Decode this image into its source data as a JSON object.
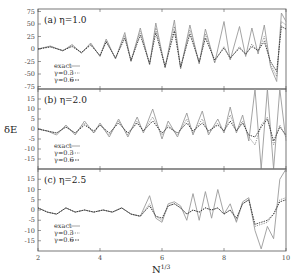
{
  "chart_data": {
    "type": "line",
    "xlabel": "N^{1/3}",
    "ylabel": "δE",
    "xlim": [
      2,
      10
    ],
    "x_ticks": [
      2,
      4,
      6,
      8,
      10
    ],
    "legend_position": "lower-left (inside each panel)",
    "grid": false,
    "series_styles": {
      "exact": {
        "color": "#9a9a9a",
        "dash": "",
        "width": 0.9
      },
      "γ=0.3": {
        "color": "#777777",
        "dash": "1.2,1.2",
        "width": 0.8
      },
      "γ=0.6": {
        "color": "#333333",
        "dash": "1.5,1",
        "width": 0.9
      }
    },
    "panels": [
      {
        "id": "a",
        "label": "(a) η=1.0",
        "ylim": [
          -80,
          80
        ],
        "y_ticks": [
          75,
          50,
          25,
          0,
          -25,
          -50,
          -75
        ],
        "legend": [
          "exact",
          "γ=0.3",
          "γ=0.6"
        ],
        "series": [
          {
            "name": "exact",
            "x": [
              2.0,
              2.4,
              2.8,
              3.1,
              3.4,
              3.7,
              4.0,
              4.2,
              4.5,
              4.8,
              5.0,
              5.3,
              5.6,
              5.8,
              6.1,
              6.4,
              6.6,
              6.9,
              7.2,
              7.4,
              7.7,
              8.0,
              8.2,
              8.5,
              8.7,
              8.9,
              9.1,
              9.3,
              9.5,
              9.7,
              9.85,
              10.0
            ],
            "y": [
              0,
              6,
              -4,
              9,
              -8,
              12,
              -15,
              20,
              -20,
              33,
              -25,
              42,
              -32,
              52,
              -38,
              58,
              -40,
              48,
              -30,
              40,
              -28,
              55,
              -22,
              45,
              -15,
              42,
              -10,
              48,
              -35,
              -65,
              72,
              55
            ]
          },
          {
            "name": "γ=0.3",
            "x": [
              2.0,
              2.4,
              2.8,
              3.1,
              3.4,
              3.7,
              4.0,
              4.2,
              4.5,
              4.8,
              5.0,
              5.3,
              5.6,
              5.8,
              6.1,
              6.4,
              6.6,
              6.9,
              7.2,
              7.4,
              7.7,
              8.0,
              8.2,
              8.5,
              8.7,
              8.9,
              9.1,
              9.3,
              9.5,
              9.7,
              9.85,
              10.0
            ],
            "y": [
              0,
              5,
              -3,
              7,
              -8,
              10,
              -14,
              17,
              -19,
              27,
              -24,
              35,
              -30,
              42,
              -36,
              45,
              -38,
              38,
              -28,
              30,
              -25,
              5,
              -20,
              5,
              -12,
              10,
              -5,
              25,
              -30,
              -55,
              55,
              48
            ]
          },
          {
            "name": "γ=0.6",
            "x": [
              2.0,
              2.4,
              2.8,
              3.1,
              3.4,
              3.7,
              4.0,
              4.2,
              4.5,
              4.8,
              5.0,
              5.3,
              5.6,
              5.8,
              6.1,
              6.4,
              6.6,
              6.9,
              7.2,
              7.4,
              7.7,
              8.0,
              8.2,
              8.5,
              8.7,
              8.9,
              9.1,
              9.3,
              9.5,
              9.7,
              9.85,
              10.0
            ],
            "y": [
              0,
              4,
              -3,
              5,
              -7,
              8,
              -13,
              14,
              -18,
              22,
              -23,
              28,
              -29,
              33,
              -35,
              36,
              -36,
              30,
              -26,
              22,
              -22,
              2,
              -18,
              2,
              -10,
              5,
              -3,
              15,
              -25,
              -45,
              45,
              40
            ]
          }
        ]
      },
      {
        "id": "b",
        "label": "(b) η=2.0",
        "ylim": [
          -20,
          20
        ],
        "y_ticks": [
          15,
          10,
          5,
          0,
          -5,
          -10,
          -15
        ],
        "legend": [
          "exact",
          "γ=0.3",
          "γ=0.6"
        ],
        "series": [
          {
            "name": "exact",
            "x": [
              2.0,
              2.3,
              2.6,
              2.9,
              3.2,
              3.5,
              3.8,
              4.0,
              4.3,
              4.6,
              4.9,
              5.2,
              5.4,
              5.7,
              6.0,
              6.2,
              6.5,
              6.8,
              7.0,
              7.3,
              7.5,
              7.8,
              8.0,
              8.2,
              8.4,
              8.6,
              8.8,
              9.0,
              9.2,
              9.4,
              9.6,
              9.8,
              10.0
            ],
            "y": [
              0,
              -1,
              -3,
              2,
              -3,
              4,
              -2,
              3,
              -4,
              5,
              -4,
              6,
              -2,
              10,
              -5,
              4,
              -4,
              8,
              -3,
              9,
              -3,
              5,
              -2,
              11,
              -2,
              7,
              -6,
              20,
              -20,
              20,
              -20,
              20,
              -6
            ]
          },
          {
            "name": "γ=0.3",
            "x": [
              2.0,
              2.3,
              2.6,
              2.9,
              3.2,
              3.5,
              3.8,
              4.0,
              4.3,
              4.6,
              4.9,
              5.2,
              5.4,
              5.7,
              6.0,
              6.2,
              6.5,
              6.8,
              7.0,
              7.3,
              7.5,
              7.8,
              8.0,
              8.2,
              8.4,
              8.6,
              8.8,
              9.0,
              9.2,
              9.4,
              9.6,
              9.8,
              10.0
            ],
            "y": [
              0,
              -1,
              -2,
              1,
              -2,
              3,
              -2,
              2,
              -3,
              4,
              -3,
              4,
              -1,
              6,
              -3,
              2,
              -3,
              5,
              -2,
              5,
              -2,
              3,
              -1,
              7,
              -1,
              4,
              -4,
              -8,
              2,
              6,
              -8,
              2,
              -4
            ]
          },
          {
            "name": "γ=0.6",
            "x": [
              2.0,
              2.3,
              2.6,
              2.9,
              3.2,
              3.5,
              3.8,
              4.0,
              4.3,
              4.6,
              4.9,
              5.2,
              5.4,
              5.7,
              6.0,
              6.2,
              6.5,
              6.8,
              7.0,
              7.3,
              7.5,
              7.8,
              8.0,
              8.2,
              8.4,
              8.6,
              8.8,
              9.0,
              9.2,
              9.4,
              9.6,
              9.8,
              10.0
            ],
            "y": [
              0,
              -1,
              -2,
              1,
              -2,
              2,
              -1,
              2,
              -2,
              3,
              -2,
              3,
              -1,
              4,
              -2,
              1,
              -2,
              3,
              -1,
              3,
              -1,
              2,
              -1,
              4,
              -1,
              3,
              -3,
              -4,
              1,
              5,
              -6,
              1,
              -3
            ]
          }
        ]
      },
      {
        "id": "c",
        "label": "(c) η=2.5",
        "ylim": [
          -20,
          20
        ],
        "y_ticks": [
          15,
          10,
          5,
          0,
          -5,
          -10,
          -15
        ],
        "legend": [
          "exact",
          "γ=0.3",
          "γ=0.6"
        ],
        "series": [
          {
            "name": "exact",
            "x": [
              2.0,
              2.3,
              2.6,
              2.9,
              3.2,
              3.5,
              3.8,
              4.1,
              4.4,
              4.7,
              5.0,
              5.3,
              5.6,
              5.8,
              6.0,
              6.2,
              6.4,
              6.6,
              6.8,
              7.0,
              7.2,
              7.4,
              7.6,
              7.8,
              8.0,
              8.2,
              8.4,
              8.6,
              8.8,
              9.0,
              9.2,
              9.4,
              9.6,
              9.8,
              10.0
            ],
            "y": [
              1,
              -1,
              -2,
              1,
              -1,
              0,
              -1,
              0,
              -1,
              1,
              -2,
              -3,
              7,
              -4,
              -6,
              3,
              4,
              2,
              -5,
              8,
              -5,
              9,
              -4,
              10,
              -2,
              3,
              -6,
              4,
              6,
              -10,
              -19,
              -8,
              -14,
              15,
              20
            ]
          },
          {
            "name": "γ=0.3",
            "x": [
              2.0,
              2.3,
              2.6,
              2.9,
              3.2,
              3.5,
              3.8,
              4.1,
              4.4,
              4.7,
              5.0,
              5.3,
              5.6,
              5.8,
              6.0,
              6.2,
              6.4,
              6.6,
              6.8,
              7.0,
              7.2,
              7.4,
              7.6,
              7.8,
              8.0,
              8.2,
              8.4,
              8.6,
              8.8,
              9.0,
              9.2,
              9.4,
              9.6,
              9.8,
              10.0
            ],
            "y": [
              1,
              -1,
              -2,
              1,
              -1,
              0,
              -1,
              0,
              -1,
              1,
              -2,
              -3,
              3,
              -3,
              -5,
              2,
              3,
              1,
              -2,
              0,
              -1,
              1,
              0,
              1,
              -2,
              0,
              -5,
              3,
              5,
              -8,
              -7,
              -6,
              -2,
              5,
              6
            ]
          },
          {
            "name": "γ=0.6",
            "x": [
              2.0,
              2.3,
              2.6,
              2.9,
              3.2,
              3.5,
              3.8,
              4.1,
              4.4,
              4.7,
              5.0,
              5.3,
              5.6,
              5.8,
              6.0,
              6.2,
              6.4,
              6.6,
              6.8,
              7.0,
              7.2,
              7.4,
              7.6,
              7.8,
              8.0,
              8.2,
              8.4,
              8.6,
              8.8,
              9.0,
              9.2,
              9.4,
              9.6,
              9.8,
              10.0
            ],
            "y": [
              1,
              -1,
              -2,
              1,
              -1,
              0,
              -1,
              0,
              -1,
              1,
              -2,
              -3,
              2,
              -3,
              -4,
              2,
              3,
              1,
              -2,
              0,
              -1,
              1,
              0,
              1,
              -2,
              0,
              -4,
              3,
              5,
              -7,
              -6,
              -5,
              -2,
              4,
              5
            ]
          }
        ]
      }
    ]
  },
  "axes": {
    "xlabel_main": "N",
    "xlabel_sup": "1/3",
    "ylabel": "δE",
    "x_tick_labels": [
      "2",
      "4",
      "6",
      "8",
      "10"
    ]
  },
  "panels": [
    {
      "label": "(a) η=1.0",
      "y_tick_labels": [
        "75",
        "50",
        "25",
        "0",
        "-25",
        "-50",
        "-75"
      ],
      "legend": [
        "exact",
        "γ=0.3",
        "γ=0.6"
      ]
    },
    {
      "label": "(b) η=2.0",
      "y_tick_labels": [
        "15",
        "10",
        "5",
        "0",
        "-5",
        "-10",
        "-15"
      ],
      "legend": [
        "exact",
        "γ=0.3",
        "γ=0.6"
      ]
    },
    {
      "label": "(c) η=2.5",
      "y_tick_labels": [
        "15",
        "10",
        "5",
        "0",
        "-5",
        "-10",
        "-15"
      ],
      "legend": [
        "exact",
        "γ=0.3",
        "γ=0.6"
      ]
    }
  ]
}
